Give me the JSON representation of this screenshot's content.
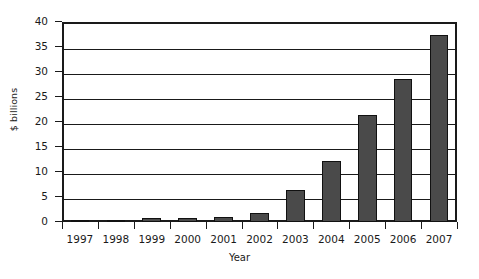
{
  "chart_data": {
    "type": "bar",
    "title": "",
    "xlabel": "Year",
    "ylabel": "$ billions",
    "categories": [
      "1997",
      "1998",
      "1999",
      "2000",
      "2001",
      "2002",
      "2003",
      "2004",
      "2005",
      "2006",
      "2007"
    ],
    "values": [
      0.1,
      0.4,
      0.9,
      0.9,
      1.0,
      1.8,
      6.4,
      12.3,
      21.4,
      28.7,
      37.5
    ],
    "series": [
      {
        "name": "",
        "values": [
          0.1,
          0.4,
          0.9,
          0.9,
          1.0,
          1.8,
          6.4,
          12.3,
          21.4,
          28.7,
          37.5
        ]
      }
    ],
    "ylim": [
      0,
      40
    ],
    "ytick_labels": [
      "0",
      "5",
      "10",
      "15",
      "20",
      "25",
      "30",
      "35",
      "40"
    ],
    "ytick_values": [
      0,
      5,
      10,
      15,
      20,
      25,
      30,
      35,
      40
    ],
    "grid": "horizontal",
    "legend": "none",
    "bar_color": "#4a4a4a",
    "bar_edge_color": "#111111",
    "axis_color": "#1a1a1a",
    "background": "#ffffff"
  }
}
